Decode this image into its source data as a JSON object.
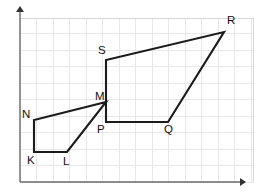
{
  "figure": {
    "width": 254,
    "height": 194,
    "background_color": "#ffffff",
    "stroke_color": "#1b1b1b",
    "grid_color": "#e9e7e7",
    "axis_color": "#6a6a6a",
    "label_color": "#111111"
  },
  "axes": {
    "x_axis": {
      "name": "x-axis",
      "from": [
        20,
        182
      ],
      "to": [
        240,
        182
      ],
      "arrow": "right"
    },
    "y_axis": {
      "name": "y-axis",
      "from": [
        20,
        182
      ],
      "to": [
        20,
        12
      ],
      "arrow": "up"
    },
    "grid_spacing": 16.5,
    "grid_visible": true,
    "tick_labels": []
  },
  "shapes": [
    {
      "name": "quadrilateral-klmn",
      "label": "KLMN",
      "closed": true,
      "points": [
        [
          34,
          152
        ],
        [
          67,
          152
        ],
        [
          106,
          102
        ],
        [
          34,
          120
        ]
      ],
      "vertices": [
        {
          "label": "K",
          "x": 34,
          "y": 152,
          "label_x": 27,
          "label_y": 164
        },
        {
          "label": "L",
          "x": 67,
          "y": 152,
          "label_x": 63,
          "label_y": 165
        },
        {
          "label": "M",
          "x": 106,
          "y": 102,
          "label_x": 95,
          "label_y": 100
        },
        {
          "label": "N",
          "x": 34,
          "y": 120,
          "label_x": 22,
          "label_y": 118
        }
      ]
    },
    {
      "name": "quadrilateral-pqrs",
      "label": "PQRS",
      "closed": true,
      "points": [
        [
          106,
          122
        ],
        [
          168,
          122
        ],
        [
          224,
          32
        ],
        [
          106,
          60
        ]
      ],
      "vertices": [
        {
          "label": "P",
          "x": 106,
          "y": 122,
          "label_x": 97,
          "label_y": 133
        },
        {
          "label": "Q",
          "x": 168,
          "y": 122,
          "label_x": 164,
          "label_y": 133
        },
        {
          "label": "R",
          "x": 224,
          "y": 32,
          "label_x": 227,
          "label_y": 24
        },
        {
          "label": "S",
          "x": 106,
          "y": 60,
          "label_x": 98,
          "label_y": 54
        }
      ]
    }
  ]
}
